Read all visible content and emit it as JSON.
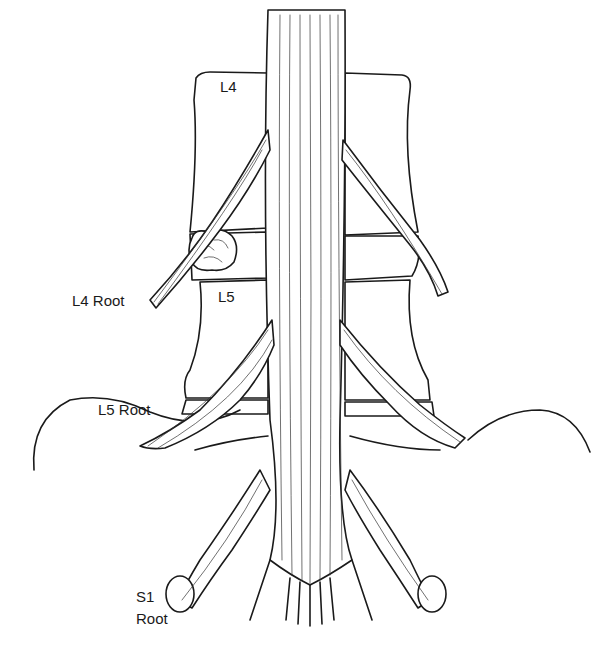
{
  "figure": {
    "type": "anatomical line drawing",
    "labels": {
      "l4": "L4",
      "l5": "L5",
      "l4_root": "L4 Root",
      "l5_root": "L5 Root",
      "s1_root_line1": "S1",
      "s1_root_line2": "Root"
    },
    "colors": {
      "ink": "#1a1a1a",
      "background": "#ffffff"
    }
  }
}
